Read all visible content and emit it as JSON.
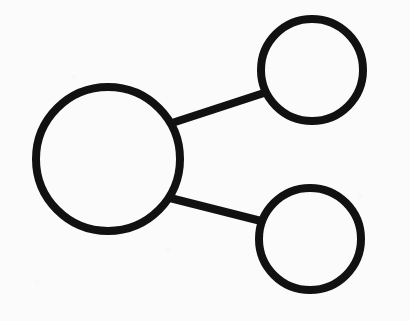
{
  "document": {
    "title": "Node Graph Diagram",
    "kind": "hand-drawn-graph-sketch",
    "width": 410,
    "height": 321
  },
  "canvas": {
    "background_color": "#fbfbfb",
    "ink_color": "#111111",
    "stroke_width": 8
  },
  "graph": {
    "node_count": 3,
    "edge_count": 2,
    "nodes": [
      {
        "id": "node-large-left",
        "label": "",
        "shape": "circle",
        "cx": 108,
        "cy": 159,
        "r": 72,
        "stroke_width": 8,
        "fill": "none",
        "stroke_color": "#111111",
        "size_class": "large"
      },
      {
        "id": "node-small-top-right",
        "label": "",
        "shape": "circle",
        "cx": 312,
        "cy": 70,
        "r": 51,
        "stroke_width": 8,
        "fill": "none",
        "stroke_color": "#111111",
        "size_class": "small"
      },
      {
        "id": "node-small-bottom-right",
        "label": "",
        "shape": "circle",
        "cx": 310,
        "cy": 239,
        "r": 51,
        "stroke_width": 8,
        "fill": "none",
        "stroke_color": "#111111",
        "size_class": "small"
      }
    ],
    "edges": [
      {
        "id": "edge-large-to-top-right",
        "from": "node-large-left",
        "to": "node-small-top-right",
        "x1": 172,
        "y1": 123,
        "x2": 267,
        "y2": 92,
        "stroke_width": 8,
        "stroke_color": "#111111"
      },
      {
        "id": "edge-large-to-bottom-right",
        "from": "node-large-left",
        "to": "node-small-bottom-right",
        "x1": 170,
        "y1": 198,
        "x2": 265,
        "y2": 222,
        "stroke_width": 8,
        "stroke_color": "#111111"
      }
    ]
  }
}
